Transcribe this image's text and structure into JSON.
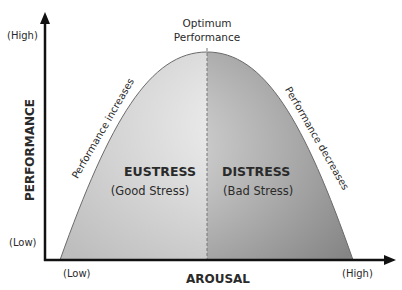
{
  "diagram": {
    "y_axis": {
      "label": "PERFORMANCE",
      "high": "(High)",
      "low": "(Low)"
    },
    "x_axis": {
      "label": "AROUSAL",
      "low": "(Low)",
      "high": "(High)"
    },
    "peak_label_line1": "Optimum",
    "peak_label_line2": "Performance",
    "left_slope_label": "Performance increases",
    "right_slope_label": "Performance decreases",
    "left_region": {
      "title": "EUSTRESS",
      "subtitle": "(Good Stress)"
    },
    "right_region": {
      "title": "DISTRESS",
      "subtitle": "(Bad Stress)"
    },
    "colors": {
      "left_fill_light": "#f2f2f2",
      "left_fill_dark": "#c4c4c4",
      "right_fill_light": "#e0e0e0",
      "right_fill_dark": "#8a8a8a",
      "axis": "#111111",
      "text": "#2a2a2a"
    }
  }
}
